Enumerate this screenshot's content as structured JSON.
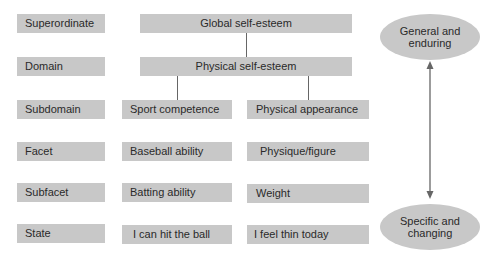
{
  "levels": [
    {
      "label": "Superordinate"
    },
    {
      "label": "Domain"
    },
    {
      "label": "Subdomain"
    },
    {
      "label": "Facet"
    },
    {
      "label": "Subfacet"
    },
    {
      "label": "State"
    }
  ],
  "hierarchy": {
    "superordinate": "Global self-esteem",
    "domain": "Physical self-esteem",
    "left_branch": {
      "subdomain": "Sport competence",
      "facet": "Baseball ability",
      "subfacet": "Batting ability",
      "state": "I can hit the ball"
    },
    "right_branch": {
      "subdomain": "Physical appearance",
      "facet": "Physique/figure",
      "subfacet": "Weight",
      "state": "I feel thin today"
    }
  },
  "continuum": {
    "top": "General and enduring",
    "bottom": "Specific and changing"
  },
  "colors": {
    "box_fill": "#c8c8c8",
    "line": "#666666",
    "text": "#2a2a2a"
  }
}
